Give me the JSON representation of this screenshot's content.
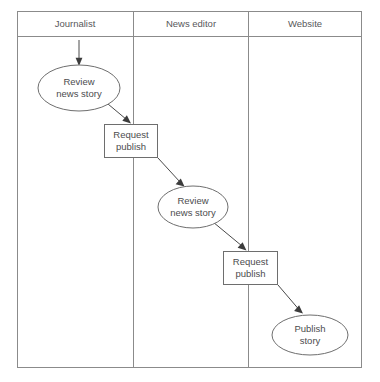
{
  "diagram": {
    "type": "swimlane-flowchart",
    "title": "",
    "colors": {
      "background": "#ffffff",
      "frame_stroke": "#8b8b8b",
      "shape_stroke": "#6e6e6e",
      "connector_stroke": "#4a4a4a",
      "text": "#4c4c4e",
      "lane_title_text": "#58585a"
    },
    "frame": {
      "x": 17,
      "y": 11,
      "width": 345,
      "height": 357
    },
    "header_rule_y": 36,
    "lanes": [
      {
        "id": "lane-journalist",
        "label": "Journalist",
        "x": 17,
        "width": 116,
        "label_cx": 75
      },
      {
        "id": "lane-news-editor",
        "label": "News editor",
        "x": 133,
        "width": 115,
        "label_cx": 191
      },
      {
        "id": "lane-website",
        "label": "Website",
        "x": 248,
        "width": 114,
        "label_cx": 305
      }
    ],
    "lane_dividers": [
      133,
      248
    ],
    "nodes": [
      {
        "id": "node-review-news-story-journalist",
        "name": "review-news-story-journalist",
        "shape": "ellipse",
        "lane": "Journalist",
        "lines": [
          "Review",
          "news story"
        ],
        "cx": 79,
        "cy": 88,
        "rx": 41,
        "ry": 23
      },
      {
        "id": "node-request-publish-1",
        "name": "request-publish-1",
        "shape": "rectangle",
        "lane": "Journalist / News editor boundary",
        "lines": [
          "Request",
          "publish"
        ],
        "x": 104,
        "y": 124,
        "width": 54,
        "height": 34
      },
      {
        "id": "node-review-news-story-editor",
        "name": "review-news-story-editor",
        "shape": "ellipse",
        "lane": "News editor",
        "lines": [
          "Review",
          "news story"
        ],
        "cx": 193,
        "cy": 207,
        "rx": 35,
        "ry": 21
      },
      {
        "id": "node-request-publish-2",
        "name": "request-publish-2",
        "shape": "rectangle",
        "lane": "News editor / Website boundary",
        "lines": [
          "Request",
          "publish"
        ],
        "x": 223,
        "y": 251,
        "width": 55,
        "height": 34
      },
      {
        "id": "node-publish-story",
        "name": "publish-story",
        "shape": "ellipse",
        "lane": "Website",
        "lines": [
          "Publish",
          "story"
        ],
        "cx": 310,
        "cy": 335,
        "rx": 38,
        "ry": 20
      }
    ],
    "connectors": [
      {
        "id": "conn-start",
        "name": "start-arrow",
        "from": "lane-title-journalist",
        "to": "node-review-news-story-journalist",
        "points": "79,40 79,64"
      },
      {
        "id": "conn-1",
        "name": "review-to-request-publish-1",
        "from": "node-review-news-story-journalist",
        "to": "node-request-publish-1",
        "points": "109,105 129,123"
      },
      {
        "id": "conn-2",
        "name": "request-publish-1-to-review-editor",
        "from": "node-request-publish-1",
        "to": "node-review-news-story-editor",
        "points": "158,158 183,186"
      },
      {
        "id": "conn-3",
        "name": "review-editor-to-request-publish-2",
        "from": "node-review-news-story-editor",
        "to": "node-request-publish-2",
        "points": "212,222 246,250"
      },
      {
        "id": "conn-4",
        "name": "request-publish-2-to-publish-story",
        "from": "node-request-publish-2",
        "to": "node-publish-story",
        "points": "278,285 302,313"
      }
    ]
  }
}
